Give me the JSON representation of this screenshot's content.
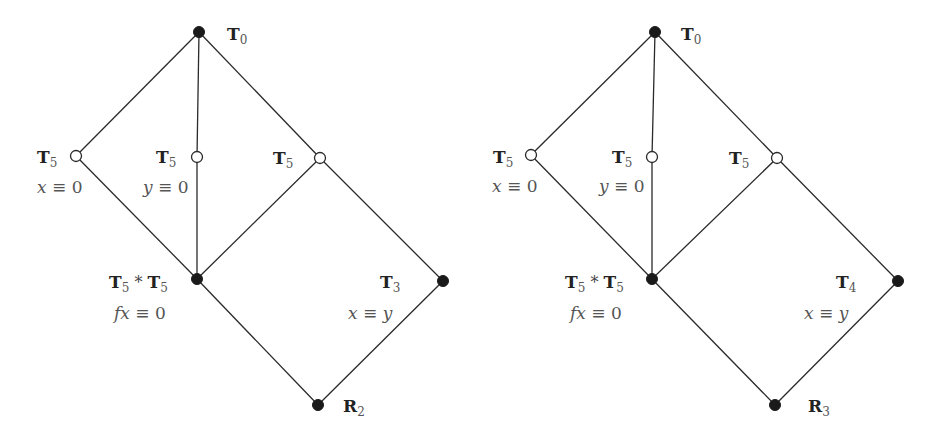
{
  "diagrams": [
    {
      "id": "left",
      "nodes": {
        "top": {
          "x": 199,
          "y": 32,
          "filled": true,
          "label": "T",
          "sub": "0"
        },
        "a": {
          "x": 76,
          "y": 156,
          "filled": false,
          "label": "T",
          "sub": "5",
          "eq_var": "x",
          "eq_op": " ≡ ",
          "eq_rhs": "0"
        },
        "b": {
          "x": 197,
          "y": 157,
          "filled": false,
          "label": "T",
          "sub": "5",
          "eq_var": "y",
          "eq_op": " ≡ ",
          "eq_rhs": "0"
        },
        "c": {
          "x": 320,
          "y": 158,
          "filled": false,
          "label": "T",
          "sub": "5"
        },
        "meet": {
          "x": 197,
          "y": 279,
          "filled": true,
          "label": "T",
          "sub": "5",
          "op": " * ",
          "label2": "T",
          "sub2": "5",
          "eq_var": "fx",
          "eq_op": " ≡ ",
          "eq_rhs": "0"
        },
        "right": {
          "x": 443,
          "y": 281,
          "filled": true,
          "label": "T",
          "sub": "3",
          "eq_var": "x",
          "eq_op": " ≡ ",
          "eq_rhs": "y"
        },
        "bottom": {
          "x": 318,
          "y": 405,
          "filled": true,
          "label": "R",
          "sub": "2"
        }
      }
    },
    {
      "id": "right",
      "nodes": {
        "top": {
          "x": 655,
          "y": 32,
          "filled": true,
          "label": "T",
          "sub": "0"
        },
        "a": {
          "x": 531,
          "y": 155,
          "filled": false,
          "label": "T",
          "sub": "5",
          "eq_var": "x",
          "eq_op": " ≡ ",
          "eq_rhs": "0"
        },
        "b": {
          "x": 652,
          "y": 157,
          "filled": false,
          "label": "T",
          "sub": "5",
          "eq_var": "y",
          "eq_op": " ≡ ",
          "eq_rhs": "0"
        },
        "c": {
          "x": 777,
          "y": 158,
          "filled": false,
          "label": "T",
          "sub": "5"
        },
        "meet": {
          "x": 652,
          "y": 279,
          "filled": true,
          "label": "T",
          "sub": "5",
          "op": " * ",
          "label2": "T",
          "sub2": "5",
          "eq_var": "fx",
          "eq_op": " ≡ ",
          "eq_rhs": "0"
        },
        "right": {
          "x": 898,
          "y": 281,
          "filled": true,
          "label": "T",
          "sub": "4",
          "eq_var": "x",
          "eq_op": " ≡ ",
          "eq_rhs": "y"
        },
        "bottom": {
          "x": 775,
          "y": 405,
          "filled": true,
          "label": "R",
          "sub": "3"
        }
      }
    }
  ],
  "edges": [
    [
      "top",
      "a"
    ],
    [
      "top",
      "b"
    ],
    [
      "top",
      "c"
    ],
    [
      "a",
      "meet"
    ],
    [
      "b",
      "meet"
    ],
    [
      "c",
      "meet"
    ],
    [
      "c",
      "right"
    ],
    [
      "meet",
      "bottom"
    ],
    [
      "right",
      "bottom"
    ]
  ]
}
